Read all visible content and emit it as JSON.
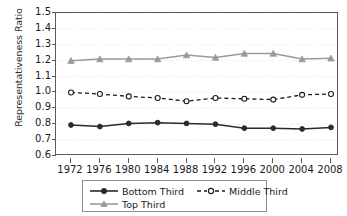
{
  "chart_data": {
    "type": "line",
    "title": "",
    "xlabel": "",
    "ylabel": "Representativeness Ratio",
    "categories": [
      1972,
      1976,
      1980,
      1984,
      1988,
      1992,
      1996,
      2000,
      2004,
      2008
    ],
    "xtick_labels": [
      "1972",
      "1976",
      "1980",
      "1984",
      "1988",
      "1992",
      "1996",
      "2000",
      "2004",
      "2008"
    ],
    "ytick_labels": [
      "1.5",
      "1.4",
      "1.3",
      "1.2",
      "1.1",
      "1.0",
      "0.9",
      "0.8",
      "0.7",
      "0.6"
    ],
    "ylim": [
      0.6,
      1.5
    ],
    "ytick_values": [
      1.5,
      1.4,
      1.3,
      1.2,
      1.1,
      1.0,
      0.9,
      0.8,
      0.7,
      0.6
    ],
    "grid": true,
    "legend_position": "bottom",
    "series": [
      {
        "name": "Bottom Third",
        "values": [
          0.795,
          0.785,
          0.805,
          0.81,
          0.805,
          0.8,
          0.775,
          0.775,
          0.77,
          0.78
        ],
        "color": "#2b2b2b",
        "line_style": "solid",
        "marker": "filled-circle"
      },
      {
        "name": "Middle Third",
        "values": [
          1.0,
          0.99,
          0.975,
          0.965,
          0.945,
          0.965,
          0.96,
          0.955,
          0.985,
          0.99
        ],
        "color": "#1a1a1a",
        "line_style": "dashed",
        "marker": "open-circle"
      },
      {
        "name": "Top Third",
        "values": [
          1.2,
          1.21,
          1.21,
          1.21,
          1.235,
          1.22,
          1.245,
          1.245,
          1.21,
          1.215
        ],
        "color": "#9a9a9a",
        "line_style": "solid",
        "marker": "filled-triangle"
      }
    ]
  },
  "legend": {
    "items": [
      {
        "label": "Bottom Third"
      },
      {
        "label": "Middle Third"
      },
      {
        "label": "Top Third"
      }
    ]
  }
}
